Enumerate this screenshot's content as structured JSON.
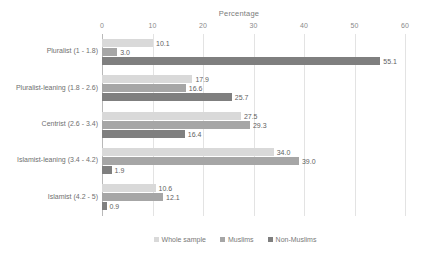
{
  "chart_data": {
    "type": "bar",
    "orientation": "horizontal",
    "title": "Percentage",
    "xlabel": "",
    "ylabel": "",
    "xlim": [
      0,
      60
    ],
    "xticks": [
      0,
      10,
      20,
      30,
      40,
      50,
      60
    ],
    "grid": true,
    "legend_position": "bottom",
    "categories": [
      "Pluralist (1 - 1.8)",
      "Pluralist-leaning (1.8 - 2.6)",
      "Centrist (2.6 - 3.4)",
      "Islamist-leaning (3.4 - 4.2)",
      "Islamist (4.2 - 5)"
    ],
    "series": [
      {
        "name": "Whole sample",
        "color": "#d9d9d9",
        "values": [
          10.1,
          17.9,
          27.5,
          34.0,
          10.6
        ],
        "labels": [
          "10.1",
          "17.9",
          "27.5",
          "34.0",
          "10.6"
        ]
      },
      {
        "name": "Muslims",
        "color": "#a6a6a6",
        "values": [
          3.0,
          16.6,
          29.3,
          39.0,
          12.1
        ],
        "labels": [
          "3.0",
          "16.6",
          "29.3",
          "39.0",
          "12.1"
        ]
      },
      {
        "name": "Non-Muslims",
        "color": "#7f7f7f",
        "values": [
          55.1,
          25.7,
          16.4,
          1.9,
          0.9
        ],
        "labels": [
          "55.1",
          "25.7",
          "16.4",
          "1.9",
          "0.9"
        ]
      }
    ]
  }
}
